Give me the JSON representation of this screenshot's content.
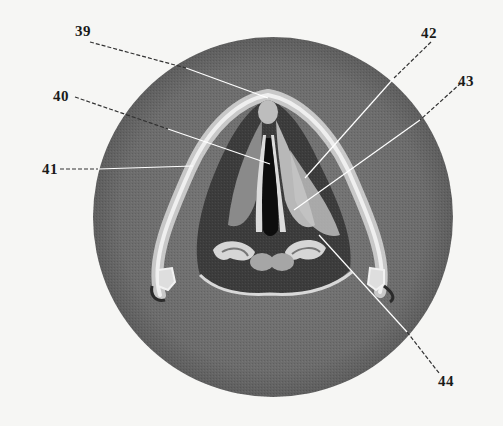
{
  "figure": {
    "colors": {
      "background": "#f6f6f4",
      "field": "#6f6f6f",
      "cavity": "#3a3a3a",
      "tissue_light": "#cfcfcf",
      "glottis": "#0d0d0d",
      "leader_line": "#ffffff",
      "label_text": "#1a1a1a"
    },
    "labels": [
      {
        "id": "39",
        "text": "39"
      },
      {
        "id": "40",
        "text": "40"
      },
      {
        "id": "41",
        "text": "41"
      },
      {
        "id": "42",
        "text": "42"
      },
      {
        "id": "43",
        "text": "43"
      },
      {
        "id": "44",
        "text": "44"
      }
    ]
  }
}
